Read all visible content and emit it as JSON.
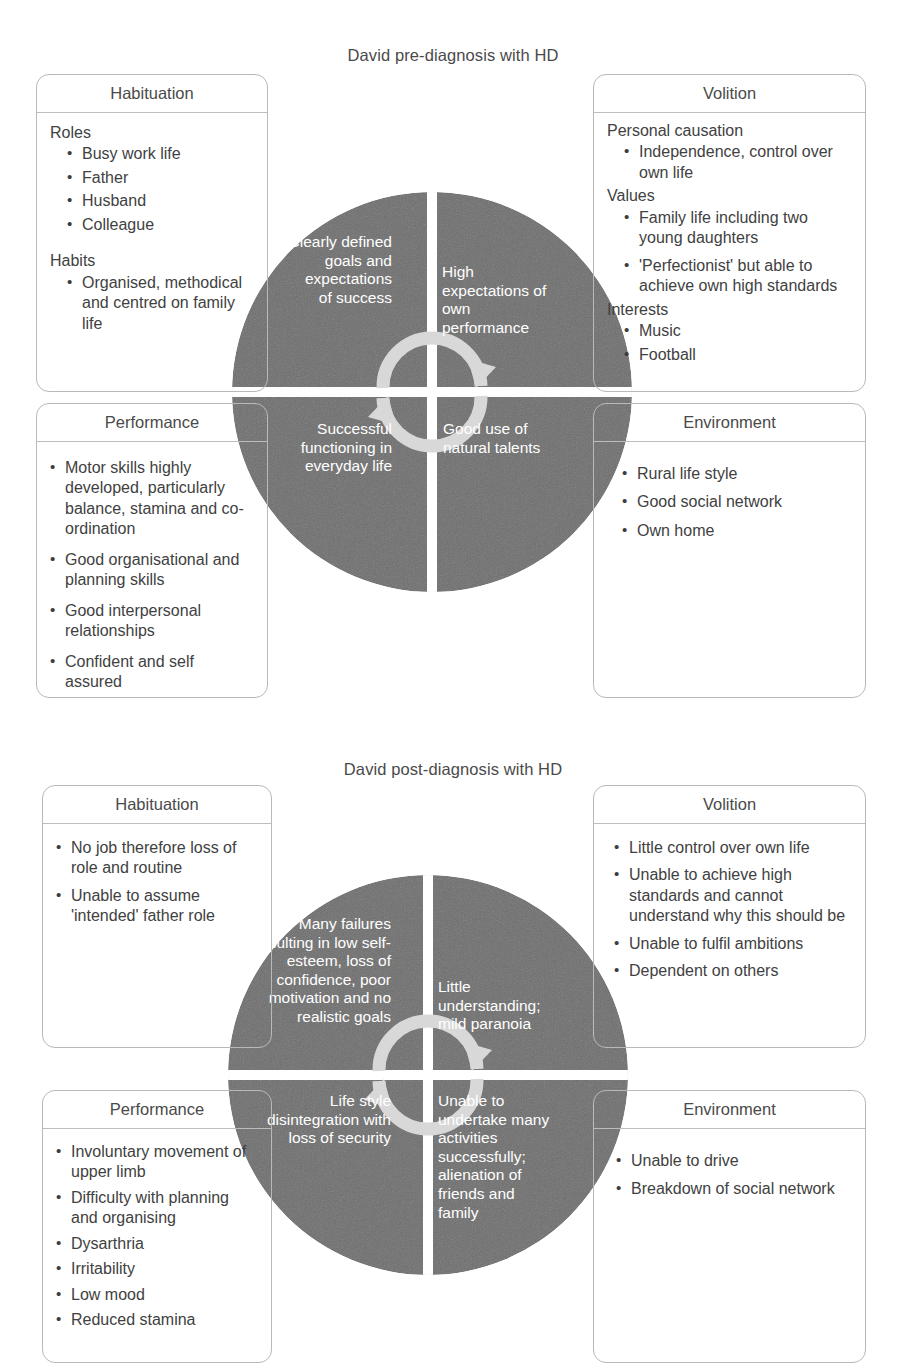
{
  "diagrams": [
    {
      "title": "David pre-diagnosis with HD",
      "boxes": {
        "habituation": {
          "header": "Habituation",
          "groups": [
            {
              "label": "Roles",
              "items": [
                "Busy work life",
                "Father",
                "Husband",
                "Colleague"
              ]
            },
            {
              "label": "Habits",
              "items": [
                "Organised, methodical and centred on family life"
              ]
            }
          ]
        },
        "volition": {
          "header": "Volition",
          "groups": [
            {
              "label": "Personal causation",
              "items": [
                "Independence, control over own life"
              ]
            },
            {
              "label": "Values",
              "items": [
                "Family life including two young daughters",
                "'Perfectionist' but able to achieve own high standards"
              ]
            },
            {
              "label": "Interests",
              "items": [
                "Music",
                "Football"
              ]
            }
          ]
        },
        "performance": {
          "header": "Performance",
          "items": [
            "Motor skills highly developed, particularly balance, stamina and co-ordination",
            "Good organisational and planning skills",
            "Good interpersonal relationships",
            "Confident and self assured"
          ]
        },
        "environment": {
          "header": "Environment",
          "items": [
            "Rural life style",
            "Good social network",
            "Own home"
          ]
        }
      },
      "wheel": {
        "top_left": "Clearly defined goals and expectations of success",
        "top_right": "High expectations of own performance",
        "bottom_left": "Successful functioning in everyday life",
        "bottom_right": "Good use of natural talents"
      }
    },
    {
      "title": "David post-diagnosis with HD",
      "boxes": {
        "habituation": {
          "header": "Habituation",
          "items": [
            "No job therefore loss of role and routine",
            "Unable to assume 'intended' father role"
          ]
        },
        "volition": {
          "header": "Volition",
          "items": [
            "Little control over own life",
            "Unable to achieve high standards and cannot understand why this should be",
            "Unable to fulfil ambitions",
            "Dependent on others"
          ]
        },
        "performance": {
          "header": "Performance",
          "items": [
            "Involuntary movement of upper limb",
            "Difficulty with planning and organising",
            "Dysarthria",
            "Irritability",
            "Low mood",
            "Reduced stamina"
          ]
        },
        "environment": {
          "header": "Environment",
          "items": [
            "Unable to drive",
            "Breakdown of social network"
          ]
        }
      },
      "wheel": {
        "top_left": "Many failures resulting in low self-esteem, loss of confidence, poor motivation and no realistic goals",
        "top_right": "Little understanding; mild paranoia",
        "bottom_left": "Life style disintegration with loss of security",
        "bottom_right": "Unable to undertake many activities successfully; alienation of friends and family"
      }
    }
  ],
  "colors": {
    "wheel_fill": "#6e6e6e",
    "wheel_text": "#ffffff",
    "box_border": "#b9b9b9",
    "text": "#414141",
    "arrow": "#d5d5d5"
  }
}
